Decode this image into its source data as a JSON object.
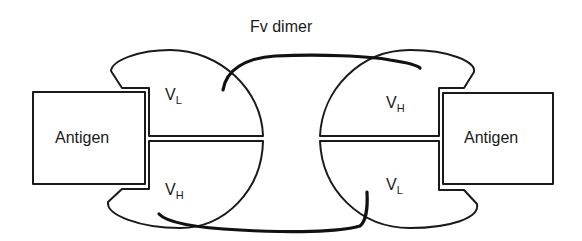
{
  "diagram": {
    "title": "Fv dimer",
    "left_unit": {
      "antigen_label": "Antigen",
      "top_domain": {
        "main": "V",
        "sub": "L"
      },
      "bottom_domain": {
        "main": "V",
        "sub": "H"
      }
    },
    "right_unit": {
      "antigen_label": "Antigen",
      "top_domain": {
        "main": "V",
        "sub": "H"
      },
      "bottom_domain": {
        "main": "V",
        "sub": "L"
      }
    },
    "linkers": [
      {
        "name": "top-linker",
        "from": "left V_L",
        "to": "right V_H"
      },
      {
        "name": "bottom-linker",
        "from": "left V_H",
        "to": "right V_L"
      }
    ],
    "colors": {
      "stroke": "#1a1a1a",
      "background": "#ffffff"
    }
  }
}
